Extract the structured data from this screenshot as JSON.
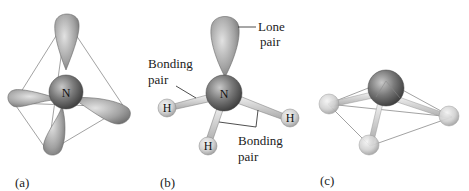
{
  "figure": {
    "panels": [
      {
        "id": "a",
        "label": "(a)",
        "center_atom": "N",
        "description": "tetrahedral electron-pair orbitals around nitrogen"
      },
      {
        "id": "b",
        "label": "(b)",
        "center_atom": "N",
        "hydrogens": [
          "H",
          "H",
          "H"
        ],
        "annotations": {
          "lone_pair": [
            "Lone",
            "pair"
          ],
          "bonding_pair_left": [
            "Bonding",
            "pair"
          ],
          "bonding_pair_right": [
            "Bonding",
            "pair"
          ]
        }
      },
      {
        "id": "c",
        "label": "(c)",
        "description": "trigonal pyramidal molecular geometry"
      }
    ],
    "colors": {
      "orbital": "#9a9a9a",
      "n_atom": "#6e6e6e",
      "h_atom": "#d4d4d4",
      "edge": "#8a8a8a",
      "text": "#222222"
    }
  }
}
